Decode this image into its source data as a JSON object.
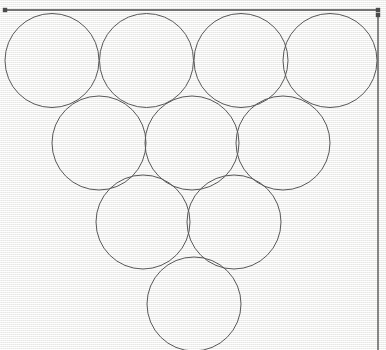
{
  "figure": {
    "canvas": {
      "width": 386,
      "height": 350,
      "background_color": "#f4f4f2",
      "texture": "paper-grid-weave"
    },
    "stroke": {
      "circle_color": "#585858",
      "circle_width": 1,
      "dimension_color": "#4a4a4a",
      "dimension_width": 1.3,
      "endpoint_marker": "square-dot"
    },
    "circle_radius": 47,
    "circle_count": 10,
    "rows": [
      {
        "row_label": "row-1",
        "count": 4,
        "center_y": 60.5,
        "centers_x": [
          52,
          146.5,
          241,
          330
        ]
      },
      {
        "row_label": "row-2",
        "count": 3,
        "center_y": 143,
        "centers_x": [
          99,
          192,
          283
        ]
      },
      {
        "row_label": "row-3",
        "count": 2,
        "center_y": 222,
        "centers_x": [
          143,
          234
        ]
      },
      {
        "row_label": "row-4",
        "count": 1,
        "center_y": 304,
        "centers_x": [
          194
        ]
      }
    ],
    "dimension_lines": [
      {
        "name": "top-width-dimension",
        "orientation": "horizontal",
        "x1": 5,
        "y1": 10,
        "x2": 378,
        "y2": 10,
        "marker_start": true,
        "marker_end": true
      },
      {
        "name": "right-height-dimension",
        "orientation": "vertical",
        "x1": 378,
        "y1": 15,
        "x2": 378,
        "y2": 350,
        "marker_start": true,
        "marker_end": false
      }
    ]
  },
  "chart_data": {
    "type": "scatter",
    "xlabel": "",
    "ylabel": "",
    "xlim": [
      0,
      386
    ],
    "ylim": [
      0,
      350
    ],
    "grid": false,
    "legend": "none",
    "annotations": [
      "top width dimension line with square end markers",
      "right height dimension line with square top marker"
    ],
    "series": [
      {
        "name": "circles",
        "marker": "open-circle",
        "radius": 47,
        "points": [
          {
            "label": "c1",
            "x": 52,
            "y": 60.5
          },
          {
            "label": "c2",
            "x": 146.5,
            "y": 60.5
          },
          {
            "label": "c3",
            "x": 241,
            "y": 60.5
          },
          {
            "label": "c4",
            "x": 330,
            "y": 60.5
          },
          {
            "label": "c5",
            "x": 99,
            "y": 143
          },
          {
            "label": "c6",
            "x": 192,
            "y": 143
          },
          {
            "label": "c7",
            "x": 283,
            "y": 143
          },
          {
            "label": "c8",
            "x": 143,
            "y": 222
          },
          {
            "label": "c9",
            "x": 234,
            "y": 222
          },
          {
            "label": "c10",
            "x": 194,
            "y": 304
          }
        ]
      }
    ]
  }
}
